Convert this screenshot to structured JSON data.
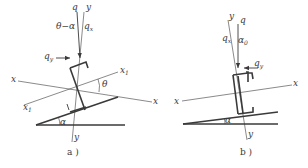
{
  "figure": {
    "panel_a": {
      "caption": "a )",
      "labels": {
        "q": "q",
        "y_top": "y",
        "theta_minus_alpha": "θ−α",
        "qx": "q",
        "qx_sub": "x",
        "qy": "q",
        "qy_sub": "y",
        "x_left": "x",
        "x_right": "x",
        "x1_right": "x",
        "x1_right_sub": "1",
        "x1_left": "x",
        "x1_left_sub": "1",
        "theta": "θ",
        "alpha": "α",
        "y_bottom": "y"
      }
    },
    "panel_b": {
      "caption": "b )",
      "labels": {
        "y_top": "y",
        "q": "q",
        "qx": "q",
        "qx_sub": "x",
        "alpha0": "α",
        "alpha0_sub": "0",
        "qy": "q",
        "qy_sub": "y",
        "x_left": "x",
        "x_right": "x",
        "alpha": "α",
        "y_bottom": "y"
      }
    },
    "colors": {
      "line": "#3a3a3a",
      "background": "#ffffff"
    }
  }
}
